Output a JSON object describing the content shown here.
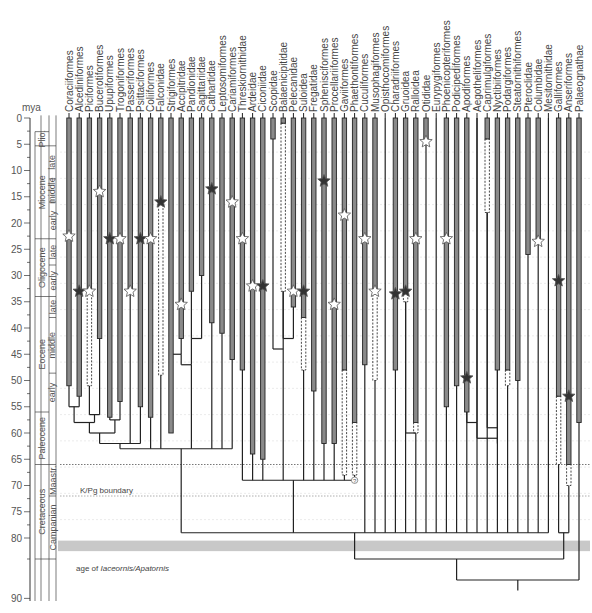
{
  "figure": {
    "axis_label": "mya",
    "y_ticks": [
      0,
      5,
      10,
      15,
      20,
      25,
      30,
      35,
      40,
      45,
      50,
      55,
      60,
      65,
      70,
      75,
      80,
      90
    ],
    "kpg_label": "K/Pg boundary",
    "kpg_age": 66,
    "maastr_lower": 72,
    "shaded_band_label_prefix": "age of ",
    "shaded_band_label_italic": "Iaceornis/Apatornis",
    "shaded_band_age": [
      80.5,
      82.5
    ],
    "epochs": [
      {
        "name": "Plio.",
        "from": 2.6,
        "to": 5.3,
        "col": "epoch"
      },
      {
        "name": "Miocene",
        "from": 5.3,
        "to": 23,
        "col": "epoch"
      },
      {
        "name": "Oligocene",
        "from": 23,
        "to": 34,
        "col": "epoch"
      },
      {
        "name": "Eocene",
        "from": 34,
        "to": 56,
        "col": "epoch"
      },
      {
        "name": "Paleocene",
        "from": 56,
        "to": 66,
        "col": "epoch"
      },
      {
        "name": "Cretaceous",
        "from": 66,
        "to": 84,
        "col": "epoch"
      },
      {
        "name": "late",
        "from": 5.3,
        "to": 11.6,
        "col": "sub"
      },
      {
        "name": "middle",
        "from": 11.6,
        "to": 16,
        "col": "sub"
      },
      {
        "name": "early",
        "from": 16,
        "to": 23,
        "col": "sub"
      },
      {
        "name": "late",
        "from": 23,
        "to": 28,
        "col": "sub"
      },
      {
        "name": "early",
        "from": 28,
        "to": 34,
        "col": "sub"
      },
      {
        "name": "late",
        "from": 34,
        "to": 38,
        "col": "sub"
      },
      {
        "name": "middle",
        "from": 38,
        "to": 48.6,
        "col": "sub"
      },
      {
        "name": "early",
        "from": 48.6,
        "to": 56,
        "col": "sub"
      },
      {
        "name": "Maastr.",
        "from": 66,
        "to": 72,
        "col": "sub"
      },
      {
        "name": "Campanian",
        "from": 72,
        "to": 84,
        "col": "sub"
      }
    ],
    "taxa": [
      "Coraciiformes",
      "Alcediniformes",
      "Piciformes",
      "Bucerotiformes",
      "Upupiformes",
      "Trogoniformes",
      "Passeriformes",
      "Psittaciformes",
      "Coliiformes",
      "Falconidae",
      "Strigiformes",
      "Accipitridae",
      "Pandionidae",
      "Sagittariidae",
      "Cathartidae",
      "Leptosomiformes",
      "Cariamiformes",
      "Threskiornithidae",
      "Ardeidae",
      "Ciconiidae",
      "Scopidae",
      "Balaenicipitidae",
      "Pelecanidae",
      "Suloidea",
      "Fregatidae",
      "Sphenisciformes",
      "Procellariiformes",
      "Gaviiformes",
      "Phaethontiformes",
      "Cuculiformes",
      "Musophagiformes",
      "Opisthocomiformes",
      "Charadriiformes",
      "Gruoidea",
      "Ralloidea",
      "Otididae",
      "Eurypygiformes",
      "Phoenicopteriformes",
      "Podicipediformes",
      "Apodiformes",
      "Aegotheliformes",
      "Caprimulgiformes",
      "Nyctibiiformes",
      "Podargiformes",
      "Steatornithiformes",
      "Pteroclidae",
      "Columbidae",
      "Mesitornithidae",
      "Galliformes",
      "Anseriformes",
      "Palaeognathae"
    ]
  },
  "chart_data": {
    "type": "phylogenetic-timetree",
    "title": "",
    "ylabel": "mya",
    "ylim": [
      0,
      90
    ],
    "reference_lines": [
      {
        "label": "K/Pg boundary",
        "age": 66
      },
      {
        "label": "age of Iaceornis/Apatornis",
        "age": 81.5
      }
    ],
    "taxa": [
      {
        "name": "Coraciiformes",
        "bar_to": 51,
        "star": 22.5,
        "star_type": "white"
      },
      {
        "name": "Alcediniformes",
        "bar_to": 53,
        "star": 33,
        "star_type": "black"
      },
      {
        "name": "Piciformes",
        "bar_to": 33,
        "dashed_to": 51,
        "star": 33,
        "star_type": "white"
      },
      {
        "name": "Bucerotiformes",
        "bar_to": 42,
        "star": 14,
        "star_type": "white"
      },
      {
        "name": "Upupiformes",
        "bar_to": 57,
        "star": 23,
        "star_type": "black"
      },
      {
        "name": "Trogoniformes",
        "bar_to": 54,
        "star": 23,
        "star_type": "white"
      },
      {
        "name": "Passeriformes",
        "bar_to": 33,
        "star": 33,
        "star_type": "white"
      },
      {
        "name": "Psittaciformes",
        "bar_to": 55,
        "star": 23,
        "star_type": "black"
      },
      {
        "name": "Coliiformes",
        "bar_to": 57,
        "star": 23,
        "star_type": "white"
      },
      {
        "name": "Falconidae",
        "bar_to": 16,
        "dashed_to": 49,
        "star": 16,
        "star_type": "black"
      },
      {
        "name": "Strigiformes",
        "bar_to": 60,
        "star": null
      },
      {
        "name": "Accipitridae",
        "bar_to": 42,
        "star": 35.5,
        "star_type": "white"
      },
      {
        "name": "Pandionidae",
        "bar_to": 33,
        "star": null
      },
      {
        "name": "Sagittariidae",
        "bar_to": 30,
        "star": null
      },
      {
        "name": "Cathartidae",
        "bar_to": 39,
        "star": 13.5,
        "star_type": "black"
      },
      {
        "name": "Leptosomiformes",
        "bar_to": 41,
        "star": null
      },
      {
        "name": "Cariamiformes",
        "bar_to": 46,
        "star": 16,
        "star_type": "white"
      },
      {
        "name": "Threskiornithidae",
        "bar_to": 48,
        "star": 23,
        "star_type": "white"
      },
      {
        "name": "Ardeidae",
        "bar_to": 64,
        "star": 32,
        "star_type": "white"
      },
      {
        "name": "Ciconiidae",
        "bar_to": 65,
        "star": 32,
        "star_type": "black"
      },
      {
        "name": "Scopidae",
        "bar_to": 4,
        "star": null
      },
      {
        "name": "Balaenicipitidae",
        "bar_to": 1,
        "dashed_to": 33,
        "star": null
      },
      {
        "name": "Pelecanidae",
        "bar_to": 36,
        "star": 33,
        "star_type": "white"
      },
      {
        "name": "Suloidea",
        "bar_to": 38,
        "dashed_to": 48,
        "star": 33,
        "star_type": "black"
      },
      {
        "name": "Fregatidae",
        "bar_to": 52,
        "star": null
      },
      {
        "name": "Sphenisciformes",
        "bar_to": 62,
        "star": 12,
        "star_type": "black"
      },
      {
        "name": "Procellariiformes",
        "bar_to": 62,
        "star": 35.5,
        "star_type": "white"
      },
      {
        "name": "Gaviiformes",
        "bar_to": 48,
        "dashed_to": 68,
        "star": 18.5,
        "star_type": "white"
      },
      {
        "name": "Phaethontiformes",
        "bar_to": 58,
        "dashed_to": 68,
        "star": null,
        "note": "?"
      },
      {
        "name": "Cuculiformes",
        "bar_to": 47,
        "star": 23,
        "star_type": "white"
      },
      {
        "name": "Musophagiformes",
        "bar_to": 33,
        "dashed_to": 50,
        "star": 33,
        "star_type": "white"
      },
      {
        "name": "Opisthocomiformes",
        "bar_to": null,
        "star": null
      },
      {
        "name": "Charadriiformes",
        "bar_to": 48,
        "star": 33.5,
        "star_type": "black"
      },
      {
        "name": "Gruoidea",
        "bar_to": 33,
        "dashed_to": 35,
        "star": 33,
        "star_type": "black"
      },
      {
        "name": "Ralloidea",
        "bar_to": 58,
        "dashed_to": 60,
        "star": 23,
        "star_type": "white"
      },
      {
        "name": "Otididae",
        "bar_to": 4,
        "star": 4.5,
        "star_type": "white"
      },
      {
        "name": "Eurypygiformes",
        "bar_to": null,
        "star": null
      },
      {
        "name": "Phoenicopteriformes",
        "bar_to": 55,
        "star": 23,
        "star_type": "white"
      },
      {
        "name": "Podicipediformes",
        "bar_to": 51,
        "star": null
      },
      {
        "name": "Apodiformes",
        "bar_to": 56,
        "star": 49.5,
        "star_type": "black"
      },
      {
        "name": "Aegotheliformes",
        "bar_to": null,
        "star": null
      },
      {
        "name": "Caprimulgiformes",
        "bar_to": 4,
        "dashed_to": 18,
        "star": null
      },
      {
        "name": "Nyctibiiformes",
        "bar_to": 48,
        "star": null
      },
      {
        "name": "Podargiformes",
        "bar_to": 48,
        "dashed_to": 51,
        "star": null
      },
      {
        "name": "Steatornithiformes",
        "bar_to": 50,
        "star": null
      },
      {
        "name": "Pteroclidae",
        "bar_to": 26,
        "star": null
      },
      {
        "name": "Columbidae",
        "bar_to": 24,
        "star": 23.5,
        "star_type": "white"
      },
      {
        "name": "Mesitornithidae",
        "bar_to": null,
        "star": null
      },
      {
        "name": "Galliformes",
        "bar_to": 53,
        "dashed_to": 66,
        "star": 31,
        "star_type": "black"
      },
      {
        "name": "Anseriformes",
        "bar_to": 66,
        "dashed_to": 70,
        "star": 53,
        "star_type": "black"
      },
      {
        "name": "Palaeognathae",
        "bar_to": 58,
        "star": null
      }
    ]
  }
}
